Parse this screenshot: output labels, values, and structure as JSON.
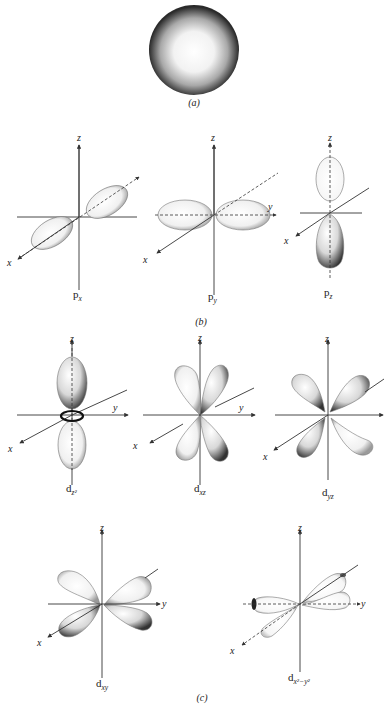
{
  "figure": {
    "panels": {
      "a": {
        "caption": "(a)",
        "orbital": "s"
      },
      "b": {
        "caption": "(b)"
      },
      "c": {
        "caption": "(c)"
      }
    },
    "axis_labels": {
      "x": "x",
      "y": "y",
      "z": "z"
    },
    "orbitals": [
      {
        "id": "px",
        "base": "p",
        "sub": "x"
      },
      {
        "id": "py",
        "base": "p",
        "sub": "y"
      },
      {
        "id": "pz",
        "base": "p",
        "sub": "z"
      },
      {
        "id": "dz2",
        "base": "d",
        "sub": "z²"
      },
      {
        "id": "dxz",
        "base": "d",
        "sub": "xz"
      },
      {
        "id": "dyz",
        "base": "d",
        "sub": "yz"
      },
      {
        "id": "dxy",
        "base": "d",
        "sub": "xy"
      },
      {
        "id": "dx2y2",
        "base": "d",
        "sub": "x²−y²"
      }
    ]
  }
}
